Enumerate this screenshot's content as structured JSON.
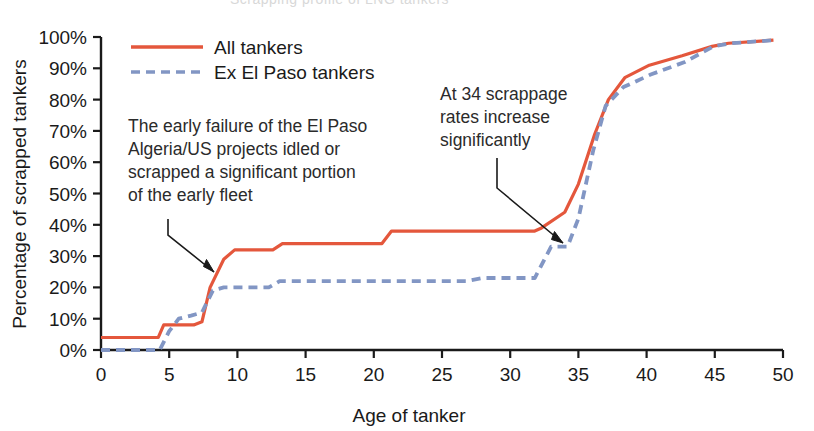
{
  "figure": {
    "background_color": "#ffffff",
    "clipped_title": "Scrapping profile of LNG tankers"
  },
  "axes": {
    "x_title": "Age of tanker",
    "y_title": "Percentage of scrapped tankers",
    "x_ticks": [
      "0",
      "5",
      "10",
      "15",
      "20",
      "25",
      "30",
      "35",
      "40",
      "45",
      "50"
    ],
    "y_ticks": [
      "0%",
      "10%",
      "20%",
      "30%",
      "40%",
      "50%",
      "60%",
      "70%",
      "80%",
      "90%",
      "100%"
    ],
    "axis_color": "#1a1a1a"
  },
  "legend": {
    "items": [
      {
        "label": "All tankers",
        "color": "#e4573c",
        "style": "solid"
      },
      {
        "label": "Ex El Paso tankers",
        "color": "#8296c4",
        "style": "dashed"
      }
    ]
  },
  "annotations": [
    {
      "id": "early-failure",
      "lines": [
        "The early failure of the El Paso",
        "Algeria/US projects idled or",
        "scrapped a significant portion",
        "of the early fleet"
      ]
    },
    {
      "id": "scrappage-at-34",
      "lines": [
        "At 34 scrappage",
        "rates increase",
        "significantly"
      ]
    }
  ],
  "chart_data": {
    "type": "line",
    "title": "Scrapping profile of LNG tankers",
    "xlabel": "Age of tanker",
    "ylabel": "Percentage of scrapped tankers",
    "xlim": [
      0,
      50
    ],
    "ylim": [
      0,
      100
    ],
    "grid": false,
    "legend_position": "top-left",
    "x_ticks": [
      0,
      5,
      10,
      15,
      20,
      25,
      30,
      35,
      40,
      45,
      50
    ],
    "y_ticks": [
      0,
      10,
      20,
      30,
      40,
      50,
      60,
      70,
      80,
      90,
      100
    ],
    "series": [
      {
        "name": "All tankers",
        "color": "#e4573c",
        "style": "solid",
        "points": [
          [
            0,
            4
          ],
          [
            4.2,
            4
          ],
          [
            4.6,
            8
          ],
          [
            6.8,
            8
          ],
          [
            7.4,
            9
          ],
          [
            8.0,
            20
          ],
          [
            9.0,
            29
          ],
          [
            9.8,
            32
          ],
          [
            12.6,
            32
          ],
          [
            13.3,
            34
          ],
          [
            20.6,
            34
          ],
          [
            21.3,
            38
          ],
          [
            31.8,
            38
          ],
          [
            32.3,
            39
          ],
          [
            34.0,
            44
          ],
          [
            35.0,
            53
          ],
          [
            36.2,
            69
          ],
          [
            37.2,
            80
          ],
          [
            38.4,
            87
          ],
          [
            40.2,
            91
          ],
          [
            42.6,
            94
          ],
          [
            44.8,
            97
          ],
          [
            46.0,
            98
          ],
          [
            49.3,
            99
          ]
        ]
      },
      {
        "name": "Ex El Paso tankers",
        "color": "#8296c4",
        "style": "dashed",
        "points": [
          [
            0,
            0
          ],
          [
            4.3,
            0
          ],
          [
            5.0,
            6
          ],
          [
            5.7,
            10
          ],
          [
            6.6,
            11
          ],
          [
            7.4,
            12
          ],
          [
            8.2,
            19
          ],
          [
            9.0,
            20
          ],
          [
            12.3,
            20
          ],
          [
            13.1,
            22
          ],
          [
            26.8,
            22
          ],
          [
            28.0,
            23
          ],
          [
            31.8,
            23
          ],
          [
            33.0,
            33
          ],
          [
            34.2,
            33
          ],
          [
            35.0,
            42
          ],
          [
            36.1,
            64
          ],
          [
            37.0,
            78
          ],
          [
            38.3,
            84
          ],
          [
            40.3,
            88
          ],
          [
            42.8,
            92
          ],
          [
            44.9,
            97
          ],
          [
            46.2,
            98
          ],
          [
            49.4,
            99
          ]
        ]
      }
    ]
  }
}
